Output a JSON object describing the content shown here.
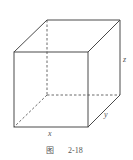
{
  "figure": {
    "caption_prefix": "图",
    "caption_number": "2-18",
    "labels": {
      "x": "x",
      "y": "y",
      "z": "z"
    },
    "colors": {
      "edge": "#4a4a4a",
      "hidden_edge": "#6a6a6a",
      "text": "#555555",
      "background": "#ffffff"
    }
  }
}
